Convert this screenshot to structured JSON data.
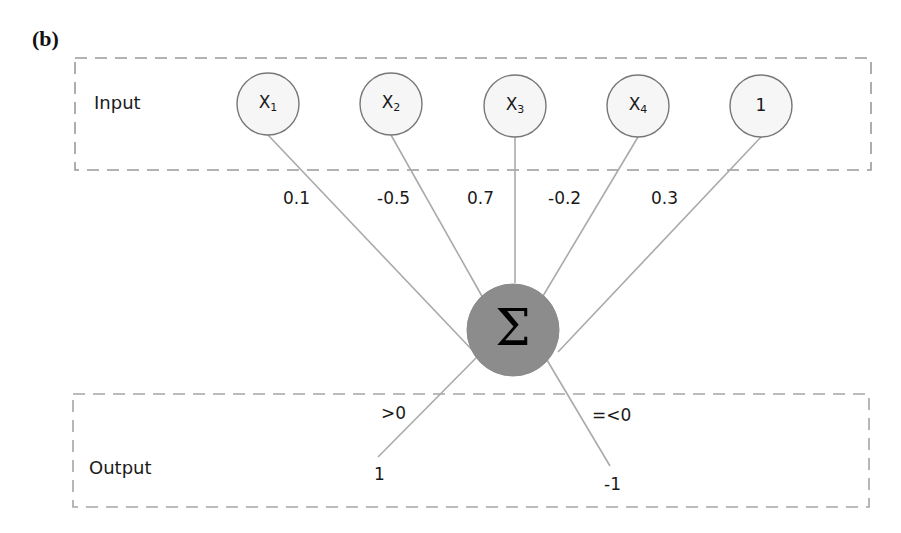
{
  "panel": {
    "label": "(b)"
  },
  "input_group": {
    "label": "Input",
    "nodes": [
      {
        "name": "X",
        "subscript": "1",
        "weight": "0.1"
      },
      {
        "name": "X",
        "subscript": "2",
        "weight": "-0.5"
      },
      {
        "name": "X",
        "subscript": "3",
        "weight": "0.7"
      },
      {
        "name": "X",
        "subscript": "4",
        "weight": "-0.2"
      },
      {
        "name": "1",
        "subscript": "",
        "weight": "0.3"
      }
    ]
  },
  "summation": {
    "symbol": "Σ",
    "icon": "summation-icon"
  },
  "output_group": {
    "label": "Output",
    "branches": [
      {
        "condition": ">0",
        "value": "1"
      },
      {
        "condition": "=<0",
        "value": "-1"
      }
    ]
  },
  "colors": {
    "node_fill": "#f6f6f6",
    "node_stroke": "#777777",
    "summation_fill": "#8c8c8c",
    "edge": "#aaaaaa",
    "dashed_border": "#999999",
    "text": "#1a1a1a"
  }
}
